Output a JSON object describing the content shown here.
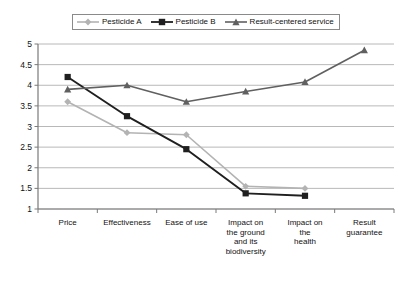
{
  "chart_data": {
    "type": "line",
    "title": "",
    "subtitle": "",
    "xlabel": "",
    "ylabel": "",
    "categories": [
      "Price",
      "Effectiveness",
      "Ease of use",
      "Impact on the ground and its biodiversity",
      "Impact on the health",
      "Result guarantee"
    ],
    "category_lines": [
      [
        "Price"
      ],
      [
        "Effectiveness"
      ],
      [
        "Ease of use"
      ],
      [
        "Impact on",
        "the ground",
        "and its",
        "biodiversity"
      ],
      [
        "Impact on",
        "the",
        "health"
      ],
      [
        "Result",
        "guarantee"
      ]
    ],
    "series": [
      {
        "name": "Pesticide A",
        "color": "#b3b3b3",
        "marker": "diamond",
        "values": [
          3.6,
          2.85,
          2.8,
          1.55,
          1.5,
          null
        ]
      },
      {
        "name": "Pesticide B",
        "color": "#1f1f1f",
        "marker": "square",
        "values": [
          4.2,
          3.25,
          2.45,
          1.38,
          1.32,
          null
        ]
      },
      {
        "name": "Result-centered service",
        "color": "#606060",
        "marker": "triangle",
        "values": [
          3.9,
          4.0,
          3.6,
          3.85,
          4.08,
          4.85
        ]
      }
    ],
    "ylim": [
      1,
      5
    ],
    "yticks": [
      "1",
      "1.5",
      "2",
      "2.5",
      "3",
      "3.5",
      "4",
      "4.5",
      "5"
    ],
    "ytick_values": [
      1,
      1.5,
      2,
      2.5,
      3,
      3.5,
      4,
      4.5,
      5
    ],
    "grid": true,
    "grid_axis": "y",
    "grid_color": "#a6a6a6",
    "legend_position": "top-center",
    "legend": [
      "Pesticide A",
      "Pesticide B",
      "Result-centered service"
    ],
    "axis_color": "#7a7a7a",
    "background": "#ffffff"
  }
}
